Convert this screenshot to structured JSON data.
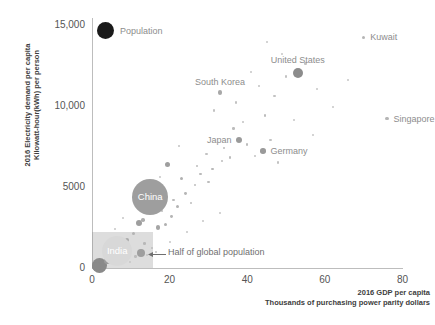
{
  "chart_data": {
    "type": "scatter",
    "title": "",
    "xlabel": "2016 GDP per capita\nThousands of purchasing power parity dollars",
    "ylabel": "2016 Electricity demand per capita\nKilowatt-hour(kWh) per person",
    "xlim": [
      0,
      80
    ],
    "ylim": [
      0,
      15000
    ],
    "xticks": [
      0,
      20,
      40,
      60,
      80
    ],
    "xticklabels": [
      "0",
      "20",
      "40",
      "60",
      "80"
    ],
    "yticks": [
      0,
      5000,
      10000,
      15000
    ],
    "yticklabels": [
      "0",
      "5000",
      "10,000",
      "15,000"
    ],
    "grid": false,
    "size_encodes": "Population",
    "legend": {
      "label": "Population",
      "position": "top-left",
      "marker": "filled-circle",
      "color": "#1a1a1a"
    },
    "annotations": [
      {
        "text": "Half of global population",
        "x": 20.5,
        "y": 950,
        "arrow": "left"
      }
    ],
    "shaded_regions": [
      {
        "label": "Half of global population",
        "x_range": [
          0,
          15.8
        ],
        "y_range": [
          0,
          2200
        ],
        "color": "#969696",
        "opacity": 0.32
      }
    ],
    "labeled_points": [
      {
        "name": "United States",
        "x": 53.0,
        "y": 12000,
        "r": 5.0,
        "color": "#8c8c8c",
        "label_pos": "above"
      },
      {
        "name": "Kuwait",
        "x": 70.0,
        "y": 14200,
        "r": 1.6,
        "color": "#b5b5b5",
        "label_pos": "right"
      },
      {
        "name": "Singapore",
        "x": 76.0,
        "y": 9200,
        "r": 1.6,
        "color": "#b5b5b5",
        "label_pos": "right"
      },
      {
        "name": "South Korea",
        "x": 33.0,
        "y": 10800,
        "r": 2.2,
        "color": "#a8a8a8",
        "label_pos": "above"
      },
      {
        "name": "Japan",
        "x": 38.0,
        "y": 7900,
        "r": 3.0,
        "color": "#9a9a9a",
        "label_pos": "left"
      },
      {
        "name": "Germany",
        "x": 44.0,
        "y": 7200,
        "r": 2.8,
        "color": "#9a9a9a",
        "label_pos": "right"
      },
      {
        "name": "China",
        "x": 15.0,
        "y": 4400,
        "r": 18.0,
        "color": "#9e9e9e",
        "label_pos": "center"
      },
      {
        "name": "India",
        "x": 6.5,
        "y": 1050,
        "r": 15.0,
        "color": "#d8d8d8",
        "label_pos": "center"
      }
    ],
    "unlabeled_points": [
      {
        "x": 2.0,
        "y": 150,
        "r": 7.5,
        "color": "#8a8a8a"
      },
      {
        "x": 1.2,
        "y": 120,
        "r": 4.5,
        "color": "#8a8a8a"
      },
      {
        "x": 4.0,
        "y": 430,
        "r": 3.2,
        "color": "#9b9b9b"
      },
      {
        "x": 12.5,
        "y": 950,
        "r": 4.0,
        "color": "#9e9e9e"
      },
      {
        "x": 9.0,
        "y": 1700,
        "r": 2.0,
        "color": "#aaaaaa"
      },
      {
        "x": 7.0,
        "y": 1400,
        "r": 1.4,
        "color": "#bbbbbb"
      },
      {
        "x": 10.8,
        "y": 2100,
        "r": 1.5,
        "color": "#b4b4b4"
      },
      {
        "x": 13.5,
        "y": 1500,
        "r": 1.3,
        "color": "#b8b8b8"
      },
      {
        "x": 15.5,
        "y": 1250,
        "r": 1.2,
        "color": "#bcbcbc"
      },
      {
        "x": 11.2,
        "y": 700,
        "r": 1.2,
        "color": "#bcbcbc"
      },
      {
        "x": 14.2,
        "y": 780,
        "r": 1.1,
        "color": "#c2c2c2"
      },
      {
        "x": 16.5,
        "y": 1000,
        "r": 1.1,
        "color": "#c2c2c2"
      },
      {
        "x": 12.0,
        "y": 2750,
        "r": 3.0,
        "color": "#9e9e9e"
      },
      {
        "x": 13.2,
        "y": 2950,
        "r": 1.8,
        "color": "#adadad"
      },
      {
        "x": 17.0,
        "y": 2500,
        "r": 2.2,
        "color": "#a5a5a5"
      },
      {
        "x": 19.0,
        "y": 2700,
        "r": 1.6,
        "color": "#b0b0b0"
      },
      {
        "x": 20.5,
        "y": 3150,
        "r": 1.4,
        "color": "#b5b5b5"
      },
      {
        "x": 18.0,
        "y": 3500,
        "r": 1.2,
        "color": "#bcbcbc"
      },
      {
        "x": 22.0,
        "y": 3800,
        "r": 1.5,
        "color": "#b2b2b2"
      },
      {
        "x": 21.0,
        "y": 4200,
        "r": 1.2,
        "color": "#bcbcbc"
      },
      {
        "x": 24.0,
        "y": 4600,
        "r": 1.4,
        "color": "#b6b6b6"
      },
      {
        "x": 25.5,
        "y": 4000,
        "r": 1.2,
        "color": "#bcbcbc"
      },
      {
        "x": 23.0,
        "y": 5500,
        "r": 1.6,
        "color": "#b0b0b0"
      },
      {
        "x": 26.5,
        "y": 5100,
        "r": 1.2,
        "color": "#bcbcbc"
      },
      {
        "x": 28.0,
        "y": 5800,
        "r": 1.3,
        "color": "#bababa"
      },
      {
        "x": 30.0,
        "y": 5300,
        "r": 1.2,
        "color": "#bcbcbc"
      },
      {
        "x": 27.0,
        "y": 6300,
        "r": 1.2,
        "color": "#bcbcbc"
      },
      {
        "x": 31.0,
        "y": 6100,
        "r": 1.3,
        "color": "#b8b8b8"
      },
      {
        "x": 33.5,
        "y": 6600,
        "r": 1.2,
        "color": "#bcbcbc"
      },
      {
        "x": 29.5,
        "y": 7000,
        "r": 1.1,
        "color": "#c2c2c2"
      },
      {
        "x": 35.5,
        "y": 6800,
        "r": 1.2,
        "color": "#bcbcbc"
      },
      {
        "x": 34.0,
        "y": 7400,
        "r": 1.2,
        "color": "#bcbcbc"
      },
      {
        "x": 40.0,
        "y": 7600,
        "r": 1.2,
        "color": "#bcbcbc"
      },
      {
        "x": 42.0,
        "y": 6900,
        "r": 1.1,
        "color": "#c2c2c2"
      },
      {
        "x": 46.0,
        "y": 7900,
        "r": 1.1,
        "color": "#c2c2c2"
      },
      {
        "x": 48.0,
        "y": 6500,
        "r": 1.1,
        "color": "#c2c2c2"
      },
      {
        "x": 36.5,
        "y": 8600,
        "r": 1.2,
        "color": "#bcbcbc"
      },
      {
        "x": 39.0,
        "y": 9000,
        "r": 1.1,
        "color": "#c2c2c2"
      },
      {
        "x": 44.5,
        "y": 9400,
        "r": 1.2,
        "color": "#bcbcbc"
      },
      {
        "x": 31.5,
        "y": 9700,
        "r": 1.1,
        "color": "#c2c2c2"
      },
      {
        "x": 37.0,
        "y": 10200,
        "r": 1.1,
        "color": "#c2c2c2"
      },
      {
        "x": 47.0,
        "y": 10600,
        "r": 1.1,
        "color": "#c2c2c2"
      },
      {
        "x": 43.0,
        "y": 11200,
        "r": 1.1,
        "color": "#c2c2c2"
      },
      {
        "x": 50.0,
        "y": 11800,
        "r": 1.1,
        "color": "#c2c2c2"
      },
      {
        "x": 55.0,
        "y": 12600,
        "r": 1.1,
        "color": "#c2c2c2"
      },
      {
        "x": 58.0,
        "y": 11000,
        "r": 1.0,
        "color": "#c6c6c6"
      },
      {
        "x": 49.0,
        "y": 13200,
        "r": 1.0,
        "color": "#c6c6c6"
      },
      {
        "x": 45.0,
        "y": 13900,
        "r": 1.0,
        "color": "#c6c6c6"
      },
      {
        "x": 62.0,
        "y": 9900,
        "r": 1.0,
        "color": "#c6c6c6"
      },
      {
        "x": 66.0,
        "y": 11600,
        "r": 1.0,
        "color": "#c6c6c6"
      },
      {
        "x": 57.0,
        "y": 8200,
        "r": 1.0,
        "color": "#c6c6c6"
      },
      {
        "x": 52.0,
        "y": 9100,
        "r": 1.0,
        "color": "#c6c6c6"
      },
      {
        "x": 41.0,
        "y": 12100,
        "r": 1.0,
        "color": "#c6c6c6"
      },
      {
        "x": 19.5,
        "y": 6400,
        "r": 2.6,
        "color": "#9e9e9e"
      },
      {
        "x": 22.5,
        "y": 7500,
        "r": 1.1,
        "color": "#c2c2c2"
      },
      {
        "x": 16.0,
        "y": 4800,
        "r": 1.2,
        "color": "#bcbcbc"
      },
      {
        "x": 17.5,
        "y": 5600,
        "r": 1.0,
        "color": "#c6c6c6"
      },
      {
        "x": 8.0,
        "y": 3100,
        "r": 1.0,
        "color": "#c6c6c6"
      },
      {
        "x": 6.0,
        "y": 2400,
        "r": 1.0,
        "color": "#c6c6c6"
      },
      {
        "x": 5.0,
        "y": 1750,
        "r": 1.2,
        "color": "#bcbcbc"
      },
      {
        "x": 3.2,
        "y": 900,
        "r": 1.1,
        "color": "#c2c2c2"
      },
      {
        "x": 7.8,
        "y": 650,
        "r": 1.1,
        "color": "#c2c2c2"
      },
      {
        "x": 9.8,
        "y": 400,
        "r": 1.0,
        "color": "#c6c6c6"
      },
      {
        "x": 20.0,
        "y": 1600,
        "r": 1.0,
        "color": "#c6c6c6"
      },
      {
        "x": 24.5,
        "y": 2200,
        "r": 1.0,
        "color": "#c6c6c6"
      },
      {
        "x": 28.5,
        "y": 2900,
        "r": 1.0,
        "color": "#c6c6c6"
      },
      {
        "x": 33.0,
        "y": 3400,
        "r": 1.0,
        "color": "#c6c6c6"
      }
    ]
  }
}
